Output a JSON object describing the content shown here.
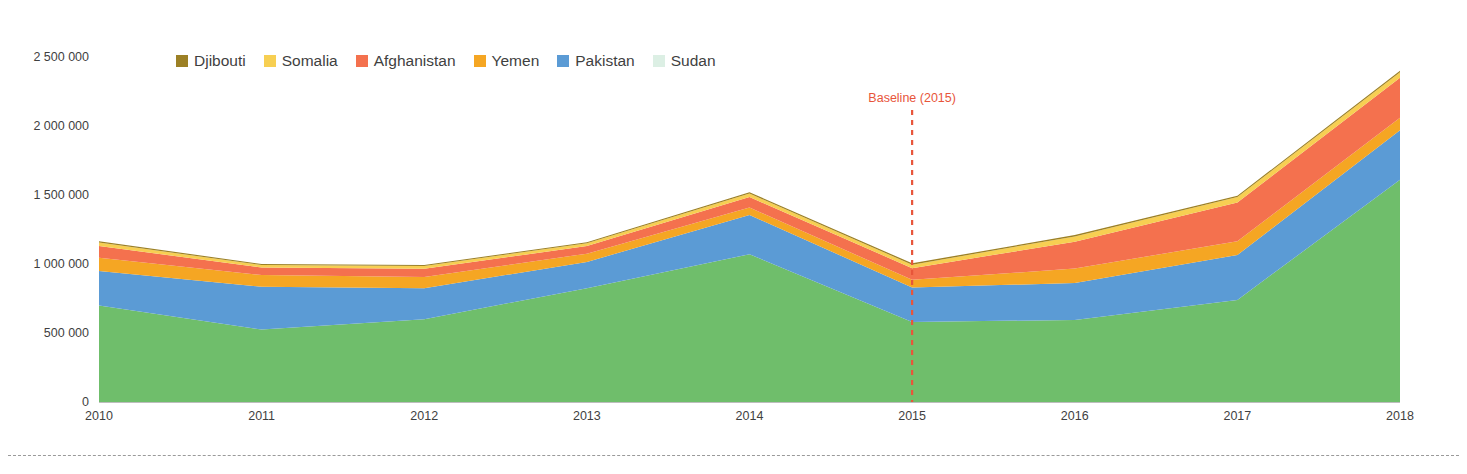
{
  "chart_data": {
    "type": "area",
    "title": "",
    "subtitle": "",
    "xlabel": "",
    "ylabel": "",
    "stacked": true,
    "grid": false,
    "legend_position": "top-left",
    "categories": [
      "2010",
      "2011",
      "2012",
      "2013",
      "2014",
      "2015",
      "2016",
      "2017",
      "2018"
    ],
    "x": [
      2010,
      2011,
      2012,
      2013,
      2014,
      2015,
      2016,
      2017,
      2018
    ],
    "ylim": [
      0,
      2500000
    ],
    "ytick_values": [
      0,
      500000,
      1000000,
      1500000,
      2000000,
      2500000
    ],
    "ytick_labels": [
      "0",
      "500 000",
      "1 000 000",
      "1 500 000",
      "2 000 000",
      "2 500 000"
    ],
    "stack_order_bottom_to_top": [
      "Sudan",
      "Pakistan",
      "Yemen",
      "Afghanistan",
      "Somalia",
      "Djibouti"
    ],
    "series": [
      {
        "name": "Sudan",
        "color": "#6FBE6B",
        "values": [
          700000,
          525000,
          600000,
          825000,
          1070000,
          580000,
          595000,
          740000,
          1610000
        ]
      },
      {
        "name": "Pakistan",
        "color": "#5B9BD5",
        "values": [
          250000,
          310000,
          225000,
          190000,
          285000,
          250000,
          267000,
          325000,
          360000
        ]
      },
      {
        "name": "Yemen",
        "color": "#F5A623",
        "values": [
          95000,
          85000,
          80000,
          60000,
          55000,
          55000,
          105000,
          100000,
          90000
        ]
      },
      {
        "name": "Afghanistan",
        "color": "#F4714E",
        "values": [
          85000,
          55000,
          60000,
          55000,
          75000,
          85000,
          195000,
          280000,
          290000
        ]
      },
      {
        "name": "Somalia",
        "color": "#F7CF52",
        "values": [
          25000,
          18000,
          20000,
          20000,
          25000,
          25000,
          38000,
          40000,
          40000
        ]
      },
      {
        "name": "Djibouti",
        "color": "#9C8025",
        "values": [
          10000,
          7000,
          8000,
          8000,
          10000,
          10000,
          10000,
          10000,
          10000
        ]
      }
    ],
    "totals": [
      1165000,
      1000000,
      993000,
      1158000,
      1520000,
      1005000,
      1210000,
      1495000,
      2400000
    ],
    "annotations": [
      {
        "name": "baseline",
        "label": "Baseline (2015)",
        "x": 2015,
        "color": "#E8553A",
        "style": "dashed-vertical-line"
      }
    ]
  },
  "legend": {
    "items": [
      {
        "label": "Djibouti",
        "color": "#9C8025"
      },
      {
        "label": "Somalia",
        "color": "#F7CF52"
      },
      {
        "label": "Afghanistan",
        "color": "#F4714E"
      },
      {
        "label": "Yemen",
        "color": "#F5A623"
      },
      {
        "label": "Pakistan",
        "color": "#5B9BD5"
      },
      {
        "label": "Sudan",
        "color": "#DCEFE4"
      }
    ]
  },
  "colors": {
    "sudan": "#6FBE6B",
    "pakistan": "#5B9BD5",
    "yemen": "#F5A623",
    "afghanistan": "#F4714E",
    "somalia": "#F7CF52",
    "djibouti": "#9C8025",
    "baseline": "#E8553A",
    "axis_text": "#3f3f3f",
    "footer_rule": "#9a9a9a"
  }
}
